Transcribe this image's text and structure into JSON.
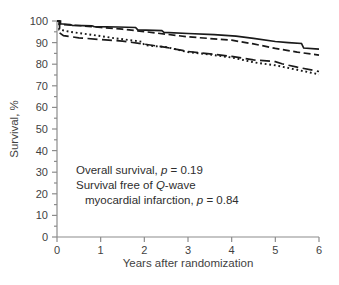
{
  "figure": {
    "background_color": "#ffffff"
  },
  "chart_data": {
    "type": "line",
    "subtype": "kaplan-meier-survival-curves",
    "title": "",
    "xlabel": "Years after randomization",
    "ylabel": "Survival, %",
    "xlim": [
      0,
      6
    ],
    "ylim": [
      0,
      100
    ],
    "x_ticks": [
      0,
      1,
      2,
      3,
      4,
      5,
      6
    ],
    "y_ticks": [
      0,
      10,
      20,
      30,
      40,
      50,
      60,
      70,
      80,
      90,
      100
    ],
    "y_minor_tick_step": 5,
    "grid": false,
    "legend_position": "none",
    "axis_color": "#8c8c8c",
    "text_color": "#3f3f3f",
    "line_color": "#1a1a1a",
    "series": [
      {
        "name": "overall-survival-solid",
        "style": "solid",
        "dash": "",
        "stroke_width": 1.7,
        "x": [
          0,
          0.05,
          0.05,
          0.3,
          0.35,
          0.8,
          0.85,
          1.4,
          1.8,
          1.85,
          2.4,
          2.45,
          3.0,
          3.6,
          4.1,
          4.5,
          5.0,
          5.3,
          5.6,
          5.65,
          6.0
        ],
        "y": [
          100,
          100,
          98.7,
          98.4,
          98.0,
          97.8,
          97.4,
          97.2,
          97.0,
          95.9,
          95.5,
          94.7,
          94.2,
          93.7,
          93.0,
          92.0,
          90.5,
          90.0,
          89.6,
          87.5,
          87.0
        ]
      },
      {
        "name": "overall-survival-dashed",
        "style": "dashed",
        "dash": "7 3.5",
        "stroke_width": 1.7,
        "x": [
          0,
          0.08,
          0.08,
          0.5,
          1.0,
          1.5,
          2.0,
          2.5,
          3.0,
          3.5,
          4.0,
          4.5,
          5.0,
          5.5,
          6.0
        ],
        "y": [
          100,
          100,
          98.4,
          97.9,
          97.0,
          96.2,
          95.1,
          93.9,
          92.7,
          91.9,
          91.1,
          89.4,
          87.3,
          85.6,
          84.2
        ]
      },
      {
        "name": "qwave-mi-free-long-dash",
        "style": "long-dash",
        "dash": "10 4.5",
        "stroke_width": 1.7,
        "x": [
          0,
          0.06,
          0.06,
          0.15,
          0.5,
          1.0,
          1.5,
          2.0,
          2.5,
          3.0,
          3.5,
          4.0,
          4.5,
          5.0,
          5.15,
          5.5,
          6.0
        ],
        "y": [
          100,
          100,
          94.5,
          93.2,
          92.2,
          91.4,
          90.7,
          89.3,
          87.8,
          85.9,
          84.8,
          83.6,
          82.0,
          81.2,
          80.2,
          78.6,
          76.6
        ]
      },
      {
        "name": "qwave-mi-free-dotted",
        "style": "dotted",
        "dash": "1.8 2.8",
        "stroke_width": 1.9,
        "x": [
          0,
          0.05,
          0.05,
          0.3,
          0.8,
          1.3,
          1.8,
          1.95,
          2.0,
          2.5,
          3.0,
          3.5,
          4.0,
          4.5,
          5.0,
          5.5,
          6.0
        ],
        "y": [
          100,
          100,
          96.0,
          95.0,
          93.6,
          92.1,
          90.8,
          90.4,
          88.8,
          87.9,
          85.6,
          84.5,
          83.1,
          80.9,
          79.5,
          77.4,
          75.3
        ]
      }
    ],
    "annotation_lines": [
      {
        "pre": "Overall survival, ",
        "italic": "p",
        "post": " = 0.19"
      },
      {
        "pre": "Survival free of ",
        "italic": "Q",
        "post": "-wave"
      },
      {
        "pre": "myocardial infarction, ",
        "italic": "p",
        "post": " = 0.84"
      }
    ],
    "comparisons": [
      {
        "label": "Overall survival",
        "p_value": "0.19"
      },
      {
        "label": "Survival free of Q-wave myocardial infarction",
        "p_value": "0.84"
      }
    ]
  }
}
